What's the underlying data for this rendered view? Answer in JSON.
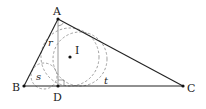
{
  "diagram": {
    "type": "geometry",
    "points": {
      "A": {
        "label": "A",
        "x": 58,
        "y": 19
      },
      "B": {
        "label": "B",
        "x": 24,
        "y": 86
      },
      "C": {
        "label": "C",
        "x": 183,
        "y": 86
      },
      "D": {
        "label": "D",
        "x": 58,
        "y": 86
      },
      "I": {
        "label": "I",
        "x": 70,
        "y": 57
      }
    },
    "segments": [
      "AB",
      "BC",
      "CA",
      "AD"
    ],
    "circles": [
      {
        "name": "incircle-ABC",
        "cx": 70,
        "cy": 57,
        "r": 29,
        "style": "dashed"
      },
      {
        "name": "incircle-ABD",
        "cx": 45,
        "cy": 76,
        "r": 13,
        "style": "dashed",
        "radius_label": "s"
      },
      {
        "name": "incircle-ADC",
        "cx": 80,
        "cy": 60,
        "r": 26,
        "style": "dashed",
        "radius_label": "t"
      }
    ],
    "radius_labels": {
      "r": "r",
      "s": "s",
      "t": "t"
    },
    "colors": {
      "line": "#222222",
      "dashed": "#888888",
      "altitude": "#999999"
    }
  }
}
